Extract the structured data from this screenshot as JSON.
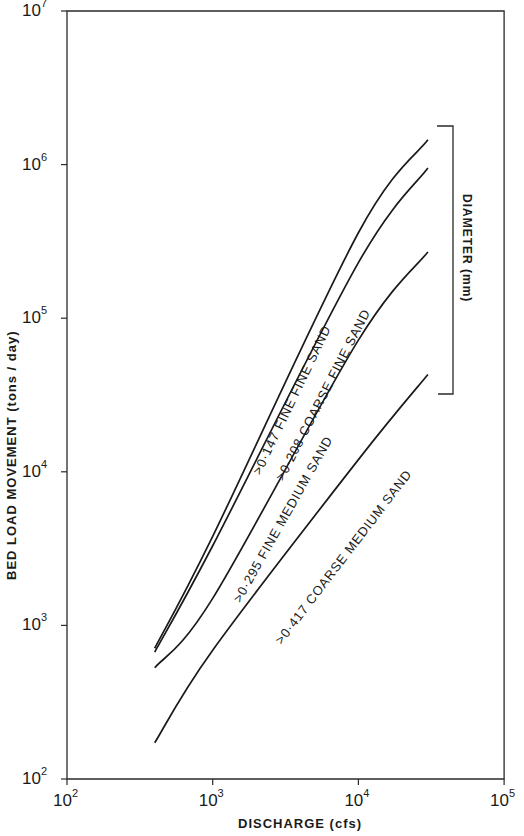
{
  "chart_data": {
    "type": "line",
    "title": "",
    "xlabel": "DISCHARGE (cfs)",
    "ylabel": "BED LOAD MOVEMENT  (tons / day)",
    "xscale": "log",
    "yscale": "log",
    "xlim": [
      100,
      100000
    ],
    "ylim": [
      100,
      10000000
    ],
    "grid": false,
    "x_ticks": [
      {
        "base": "10",
        "exp": "2"
      },
      {
        "base": "10",
        "exp": "3"
      },
      {
        "base": "10",
        "exp": "4"
      },
      {
        "base": "10",
        "exp": "5"
      }
    ],
    "y_ticks": [
      {
        "base": "10",
        "exp": "2"
      },
      {
        "base": "10",
        "exp": "3"
      },
      {
        "base": "10",
        "exp": "4"
      },
      {
        "base": "10",
        "exp": "5"
      },
      {
        "base": "10",
        "exp": "6"
      },
      {
        "base": "10",
        "exp": "7"
      }
    ],
    "bracket_label": "DIAMETER (mm)",
    "series": [
      {
        "name": ">0·147  FINE FINE SAND",
        "diameter_mm": ">0.147",
        "points": [
          [
            400,
            710
          ],
          [
            1000,
            3800
          ],
          [
            10000,
            360000
          ],
          [
            30000,
            1450000
          ]
        ]
      },
      {
        "name": ">0·208  COARSE FINE SAND",
        "diameter_mm": ">0.208",
        "points": [
          [
            400,
            670
          ],
          [
            1000,
            3300
          ],
          [
            10000,
            230000
          ],
          [
            30000,
            950000
          ]
        ]
      },
      {
        "name": ">0·295  FINE MEDIUM SAND",
        "diameter_mm": ">0.295",
        "points": [
          [
            400,
            530
          ],
          [
            1000,
            1500
          ],
          [
            10000,
            72000
          ],
          [
            30000,
            270000
          ]
        ]
      },
      {
        "name": ">0·417  COARSE MEDIUM SAND",
        "diameter_mm": ">0.417",
        "points": [
          [
            400,
            172
          ],
          [
            1000,
            690
          ],
          [
            10000,
            12000
          ],
          [
            30000,
            43000
          ]
        ]
      }
    ]
  }
}
